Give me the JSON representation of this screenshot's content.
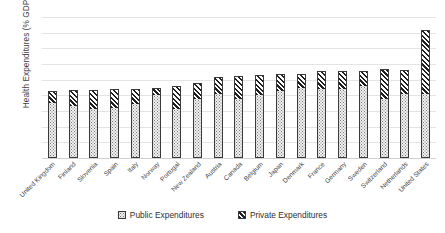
{
  "chart_data": {
    "type": "bar",
    "subtype": "stacked-bar",
    "title": "",
    "xlabel": "",
    "ylabel": "Health Expenditures (% GDP)",
    "ylim": [
      0,
      18
    ],
    "ytick_step": 2,
    "yticks": [
      18,
      16,
      14,
      12,
      10,
      8,
      6,
      4,
      2,
      0
    ],
    "grid": true,
    "legend_position": "bottom",
    "categories": [
      "United Kingdom",
      "Finland",
      "Slovenia",
      "Spain",
      "Italy",
      "Norway",
      "Portugal",
      "New Zealand",
      "Austria",
      "Canada",
      "Belgium",
      "Japan",
      "Denmark",
      "France",
      "Germany",
      "Sweden",
      "Switzerland",
      "Netherlands",
      "United States"
    ],
    "series": [
      {
        "name": "Public Expenditures",
        "pattern": "dotted",
        "color": "#f2f2f2",
        "values": [
          7.0,
          6.6,
          6.3,
          6.4,
          6.9,
          8.0,
          6.2,
          7.5,
          8.2,
          7.5,
          8.0,
          8.5,
          8.9,
          8.8,
          8.8,
          9.2,
          7.5,
          8.2,
          8.2
        ]
      },
      {
        "name": "Private Expenditures",
        "pattern": "diagonal-stripes",
        "color": "#1f1f1f",
        "values": [
          1.6,
          2.1,
          2.4,
          2.4,
          1.9,
          1.0,
          3.0,
          2.1,
          2.2,
          3.0,
          2.6,
          2.2,
          1.8,
          2.3,
          2.3,
          1.9,
          3.8,
          3.0,
          8.2
        ]
      }
    ],
    "totals": [
      8.6,
      8.7,
      8.7,
      8.8,
      8.8,
      9.0,
      9.2,
      9.6,
      10.4,
      10.5,
      10.6,
      10.7,
      10.7,
      11.1,
      11.1,
      11.1,
      11.3,
      11.2,
      16.4
    ]
  },
  "legend": {
    "items": [
      {
        "label": "Public Expenditures",
        "key": "public"
      },
      {
        "label": "Private Expenditures",
        "key": "private"
      }
    ]
  }
}
